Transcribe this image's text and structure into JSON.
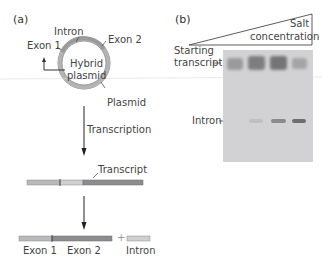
{
  "panel_a": {
    "label": "(a)",
    "plasmid": {
      "center_text_line1": "Hybrid",
      "center_text_line2": "plasmid",
      "labels": {
        "intron": "Intron",
        "exon1": "Exon 1",
        "exon2": "Exon 2",
        "plasmid": "Plasmid"
      }
    },
    "step1": "Transcription",
    "transcript_label": "Transcript",
    "products": {
      "exon1": "Exon 1",
      "exon2": "Exon 2",
      "plus": "+",
      "intron": "Intron"
    }
  },
  "panel_b": {
    "label": "(b)",
    "gradient_label_line1": "Salt",
    "gradient_label_line2": "concentration",
    "row_labels": {
      "starting_line1": "Starting",
      "starting_line2": "transcript",
      "intron": "Intron"
    },
    "lanes": [
      {
        "starting_intensity": 0.55,
        "intron_intensity": 0.0
      },
      {
        "starting_intensity": 0.7,
        "intron_intensity": 0.12
      },
      {
        "starting_intensity": 0.75,
        "intron_intensity": 0.45
      },
      {
        "starting_intensity": 0.45,
        "intron_intensity": 0.6
      }
    ]
  },
  "colors": {
    "exon_light": "#b9b9bb",
    "exon_dark": "#8d8d8f",
    "intron_light": "#cfcfd1",
    "ring": "#a8a8aa",
    "gel_bg": "#d2d2d4",
    "band": "#505052"
  }
}
